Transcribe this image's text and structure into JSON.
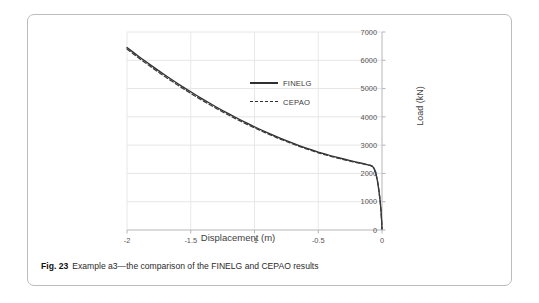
{
  "figure": {
    "caption_number": "Fig. 23",
    "caption_text": "Example a3—the comparison of the FINELG and CEPAO results"
  },
  "legend": {
    "position": "inside-top-center",
    "items": [
      {
        "label": "FINELG",
        "style": "solid"
      },
      {
        "label": "CEPAO",
        "style": "dashed"
      }
    ]
  },
  "chart_data": {
    "type": "line",
    "title": "",
    "subtitle": "",
    "xlabel": "Displacement (m)",
    "ylabel": "Load (kN)",
    "xlim": [
      -2,
      0
    ],
    "ylim": [
      0,
      7000
    ],
    "xticks": [
      "-2",
      "-1.5",
      "-1",
      "-0.5",
      "0"
    ],
    "xtick_values": [
      -2,
      -1.5,
      -1,
      -0.5,
      0
    ],
    "yticks": [
      "0",
      "1000",
      "2000",
      "3000",
      "4000",
      "5000",
      "6000",
      "7000"
    ],
    "ytick_values": [
      0,
      1000,
      2000,
      3000,
      4000,
      5000,
      6000,
      7000
    ],
    "y_axis_side": "right",
    "grid": true,
    "grid_axes": "both",
    "legend": [
      "FINELG",
      "CEPAO"
    ],
    "annotations": [],
    "series": [
      {
        "name": "FINELG",
        "style": "solid",
        "color": "#2f2f2f",
        "x": [
          -2.0,
          -1.95,
          -1.9,
          -1.85,
          -1.8,
          -1.75,
          -1.7,
          -1.65,
          -1.6,
          -1.55,
          -1.5,
          -1.45,
          -1.4,
          -1.35,
          -1.3,
          -1.25,
          -1.2,
          -1.15,
          -1.1,
          -1.05,
          -1.0,
          -0.95,
          -0.9,
          -0.85,
          -0.8,
          -0.75,
          -0.7,
          -0.65,
          -0.6,
          -0.55,
          -0.5,
          -0.45,
          -0.4,
          -0.35,
          -0.3,
          -0.25,
          -0.2,
          -0.16,
          -0.13,
          -0.11,
          -0.095,
          -0.085,
          -0.075,
          -0.065,
          -0.055,
          -0.045,
          -0.035,
          -0.025,
          -0.015,
          -0.008,
          -0.003,
          0.0
        ],
        "y": [
          6450,
          6280,
          6110,
          5945,
          5785,
          5625,
          5470,
          5320,
          5170,
          5025,
          4885,
          4745,
          4610,
          4480,
          4350,
          4225,
          4105,
          3985,
          3870,
          3760,
          3650,
          3545,
          3445,
          3345,
          3250,
          3160,
          3070,
          2985,
          2905,
          2830,
          2755,
          2690,
          2625,
          2565,
          2510,
          2455,
          2400,
          2360,
          2330,
          2305,
          2290,
          2275,
          2250,
          2200,
          2100,
          1940,
          1720,
          1420,
          1050,
          700,
          330,
          40
        ]
      },
      {
        "name": "CEPAO",
        "style": "dashed",
        "color": "#3a3a3a",
        "x": [
          -2.0,
          -1.95,
          -1.9,
          -1.85,
          -1.8,
          -1.75,
          -1.7,
          -1.65,
          -1.6,
          -1.55,
          -1.5,
          -1.45,
          -1.4,
          -1.35,
          -1.3,
          -1.25,
          -1.2,
          -1.15,
          -1.1,
          -1.05,
          -1.0,
          -0.95,
          -0.9,
          -0.85,
          -0.8,
          -0.75,
          -0.7,
          -0.65,
          -0.6,
          -0.55,
          -0.5,
          -0.45,
          -0.4,
          -0.35,
          -0.3,
          -0.25,
          -0.2,
          -0.16,
          -0.13,
          -0.11,
          -0.095,
          -0.085,
          -0.075,
          -0.065,
          -0.055,
          -0.045,
          -0.035,
          -0.025,
          -0.015,
          -0.008,
          -0.003,
          0.0
        ],
        "y": [
          6400,
          6225,
          6055,
          5890,
          5730,
          5570,
          5415,
          5265,
          5115,
          4970,
          4830,
          4692,
          4558,
          4428,
          4300,
          4178,
          4058,
          3940,
          3828,
          3718,
          3610,
          3508,
          3408,
          3312,
          3218,
          3128,
          3042,
          2958,
          2878,
          2802,
          2730,
          2665,
          2602,
          2545,
          2490,
          2438,
          2385,
          2348,
          2320,
          2298,
          2282,
          2268,
          2245,
          2196,
          2096,
          1936,
          1716,
          1416,
          1046,
          696,
          326,
          36
        ]
      }
    ]
  }
}
